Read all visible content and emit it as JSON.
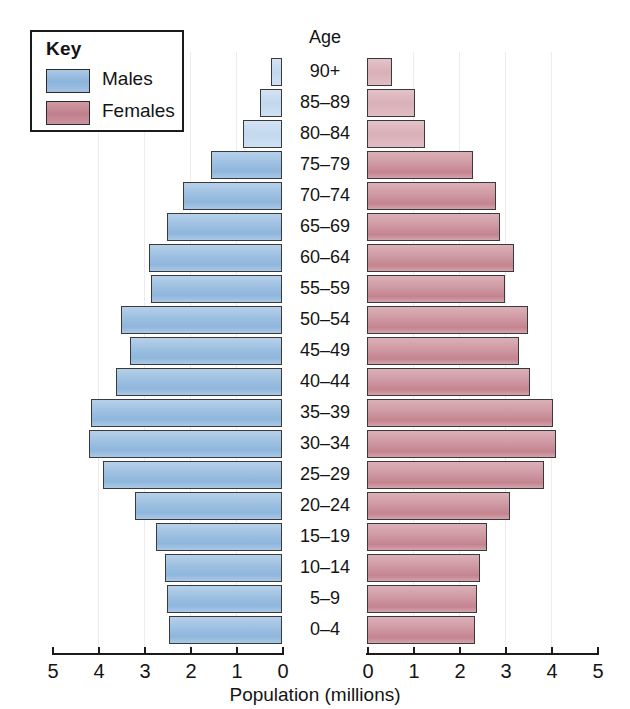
{
  "legend": {
    "title": "Key",
    "entries": [
      {
        "label": "Males",
        "color": "#9cbfe1",
        "icon": "male-swatch"
      },
      {
        "label": "Females",
        "color": "#c4848f",
        "icon": "female-swatch"
      }
    ]
  },
  "axis": {
    "age_header": "Age",
    "x_title": "Population (millions)",
    "left_ticks": [
      "5",
      "4",
      "3",
      "2",
      "1",
      "0"
    ],
    "right_ticks": [
      "0",
      "1",
      "2",
      "3",
      "4",
      "5"
    ]
  },
  "chart_data": {
    "type": "bar",
    "subtype": "population-pyramid",
    "title": "",
    "xlabel": "Population (millions)",
    "ylabel": "Age",
    "xlim": [
      0,
      5
    ],
    "grid": true,
    "legend_position": "top-left",
    "categories": [
      "90+",
      "85–89",
      "80–84",
      "75–79",
      "70–74",
      "65–69",
      "60–64",
      "55–59",
      "50–54",
      "45–49",
      "40–44",
      "35–39",
      "30–34",
      "25–29",
      "20–24",
      "15–19",
      "10–14",
      "5–9",
      "0–4"
    ],
    "series": [
      {
        "name": "Males",
        "direction": "left",
        "color": "#9cbfe1",
        "values": [
          0.24,
          0.48,
          0.85,
          1.55,
          2.15,
          2.5,
          2.9,
          2.85,
          3.5,
          3.3,
          3.6,
          4.15,
          4.2,
          3.9,
          3.2,
          2.75,
          2.55,
          2.5,
          2.45
        ]
      },
      {
        "name": "Females",
        "direction": "right",
        "color": "#c4848f",
        "values": [
          0.55,
          1.05,
          1.25,
          2.3,
          2.8,
          2.9,
          3.2,
          3.0,
          3.5,
          3.3,
          3.55,
          4.05,
          4.1,
          3.85,
          3.1,
          2.6,
          2.45,
          2.4,
          2.35
        ]
      }
    ],
    "gridline_values": [
      1,
      2,
      3,
      4
    ]
  }
}
